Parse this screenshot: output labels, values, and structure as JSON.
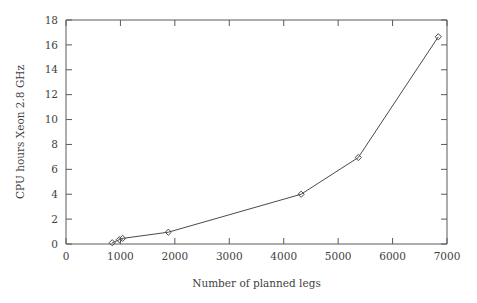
{
  "chart_data": {
    "type": "line",
    "title": "",
    "xlabel": "Number of planned legs",
    "ylabel": "CPU hours Xeon 2.8 GHz",
    "xlim": [
      0,
      7000
    ],
    "ylim": [
      0,
      18
    ],
    "xticks": [
      0,
      1000,
      2000,
      3000,
      4000,
      5000,
      6000,
      7000
    ],
    "xtick_labels": [
      "0",
      "1000",
      "2000",
      "3000",
      "4000",
      "5000",
      "6000",
      "7000"
    ],
    "yticks": [
      0,
      2,
      4,
      6,
      8,
      10,
      12,
      14,
      16,
      18
    ],
    "ytick_labels": [
      "0",
      "2",
      "4",
      "6",
      "8",
      "10",
      "12",
      "14",
      "16",
      "18"
    ],
    "grid": false,
    "legend": null,
    "marker": "diamond",
    "line_color": "#4a4a4a",
    "marker_color": "#4a4a4a",
    "axis_color": "#5a5a5a",
    "background": "#ffffff",
    "series": [
      {
        "name": "CPU hours",
        "x": [
          850,
          980,
          1040,
          1880,
          4320,
          5370,
          6840
        ],
        "y": [
          0.1,
          0.35,
          0.45,
          0.95,
          4.0,
          6.95,
          16.65
        ]
      }
    ]
  }
}
